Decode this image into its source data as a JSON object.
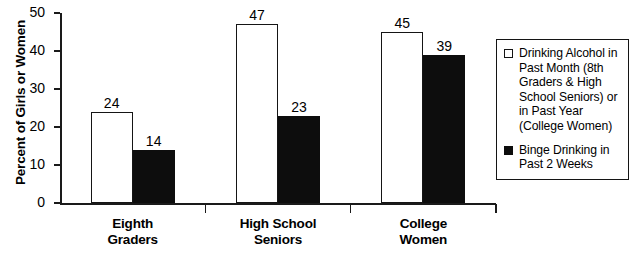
{
  "chart_data": {
    "type": "bar",
    "title": "",
    "subtitle": "",
    "xlabel": "",
    "ylabel": "Percent of Girls or Women",
    "categories": [
      "Eighth Graders",
      "High School Seniors",
      "College Women"
    ],
    "category_lines": [
      [
        "Eighth",
        "Graders"
      ],
      [
        "High School",
        "Seniors"
      ],
      [
        "College",
        "Women"
      ]
    ],
    "series": [
      {
        "name": "Drinking Alcohol in Past Month (8th Graders & High School Seniors) or in Past Year (College Women)",
        "values": [
          24,
          47,
          45
        ],
        "color": "#ffffff",
        "edge_color": "#151515",
        "swatch": "light"
      },
      {
        "name": "Binge Drinking in Past 2 Weeks",
        "values": [
          14,
          23,
          39
        ],
        "color": "#0d0d0d",
        "edge_color": "#0d0d0d",
        "swatch": "dark"
      }
    ],
    "yticks": [
      0,
      10,
      20,
      30,
      40,
      50
    ],
    "ytick_labels": [
      "0",
      "10",
      "20",
      "30",
      "40",
      "50"
    ],
    "ylim": [
      0,
      50
    ],
    "grid": false,
    "legend_position": "right",
    "value_labels_shown": true
  },
  "legend": {
    "entries": [
      {
        "swatch": "light",
        "lines": [
          "Drinking Alcohol in",
          "Past Month (8th",
          "Graders & High",
          "School Seniors) or",
          "in Past Year",
          "(College Women)"
        ]
      },
      {
        "swatch": "dark",
        "lines": [
          "Binge Drinking in",
          "Past 2 Weeks"
        ]
      }
    ]
  }
}
